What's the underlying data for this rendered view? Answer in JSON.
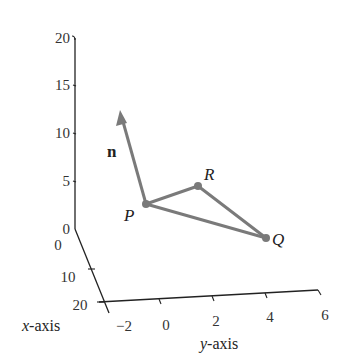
{
  "diagram": {
    "type": "3d-coordinate-plot",
    "colors": {
      "axis": "#222222",
      "geometry": "#7a7a7a",
      "text": "#222222"
    },
    "z_axis": {
      "ticks": [
        "0",
        "5",
        "10",
        "15",
        "20"
      ]
    },
    "x_axis": {
      "title_var": "x",
      "title_suffix": "-axis",
      "ticks": [
        "0",
        "10",
        "20"
      ]
    },
    "y_axis": {
      "title_var": "y",
      "title_suffix": "-axis",
      "ticks": [
        "−2",
        "0",
        "2",
        "4",
        "6"
      ]
    },
    "points": {
      "P": "P",
      "Q": "Q",
      "R": "R"
    },
    "normal_vector": {
      "label": "n"
    }
  }
}
